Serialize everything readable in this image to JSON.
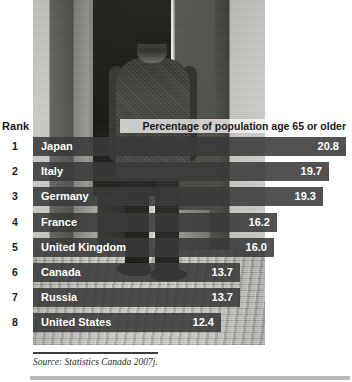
{
  "figure": {
    "rank_header": "Rank",
    "value_header": "Percentage of population age 65 or older",
    "source": "Source: Statistics Canada 2007j.",
    "photo_alt": "elderly-man-walking-street-photo"
  },
  "chart_data": {
    "type": "bar",
    "title": "Percentage of population age 65 or older",
    "xlabel": "",
    "ylabel": "",
    "orientation": "horizontal",
    "grid": false,
    "legend": false,
    "xlim": [
      0,
      21.2
    ],
    "source": "Source: Statistics Canada 2007j.",
    "categories": [
      "Japan",
      "Italy",
      "Germany",
      "France",
      "United Kingdom",
      "Canada",
      "Russia",
      "United States"
    ],
    "values": [
      20.8,
      19.7,
      19.3,
      16.2,
      16.0,
      13.7,
      13.7,
      12.4
    ],
    "ranks": [
      1,
      2,
      3,
      4,
      5,
      6,
      7,
      8
    ],
    "rows": [
      {
        "rank": "1",
        "name": "Japan",
        "value": "20.8",
        "bar_width": 313
      },
      {
        "rank": "2",
        "name": "Italy",
        "value": "19.7",
        "bar_width": 296
      },
      {
        "rank": "3",
        "name": "Germany",
        "value": "19.3",
        "bar_width": 290
      },
      {
        "rank": "4",
        "name": "France",
        "value": "16.2",
        "bar_width": 244
      },
      {
        "rank": "5",
        "name": "United Kingdom",
        "value": "16.0",
        "bar_width": 241
      },
      {
        "rank": "6",
        "name": "Canada",
        "value": "13.7",
        "bar_width": 207
      },
      {
        "rank": "7",
        "name": "Russia",
        "value": "13.7",
        "bar_width": 207
      },
      {
        "rank": "8",
        "name": "United States",
        "value": "12.4",
        "bar_width": 188
      }
    ]
  },
  "colors": {
    "bar": "#3a3a3a",
    "text_on_bar": "#ffffff",
    "label": "#1a1a1a",
    "rule": "#3c3c3c",
    "bottom_rule": "#b9b9b9"
  }
}
